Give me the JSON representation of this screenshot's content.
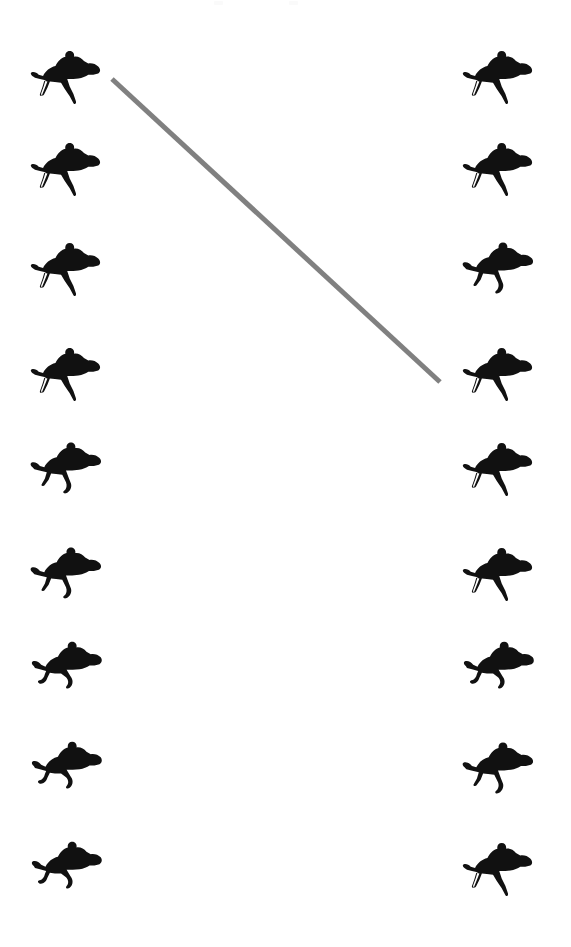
{
  "page": {
    "width": 571,
    "height": 947,
    "background_color": "#ffffff"
  },
  "figure": {
    "type": "silhouette-grid-with-connector",
    "icon_name": "horse-jockey-silhouette",
    "silhouette_color": "#111111",
    "rows": 9,
    "columns": 2
  },
  "columns": [
    {
      "name": "left-column",
      "side": "left",
      "x": 28,
      "count": 9,
      "items": [
        {
          "index": 1,
          "label": "left-horse-1",
          "y": 48,
          "pose": "gallop-extended"
        },
        {
          "index": 2,
          "label": "left-horse-2",
          "y": 140,
          "pose": "gallop-extended"
        },
        {
          "index": 3,
          "label": "left-horse-3",
          "y": 240,
          "pose": "gallop-extended"
        },
        {
          "index": 4,
          "label": "left-horse-4",
          "y": 345,
          "pose": "gallop-extended"
        },
        {
          "index": 5,
          "label": "left-horse-5",
          "y": 440,
          "pose": "gallop-collected"
        },
        {
          "index": 6,
          "label": "left-horse-6",
          "y": 545,
          "pose": "gallop-collected"
        },
        {
          "index": 7,
          "label": "left-horse-7",
          "y": 640,
          "pose": "gallop-tucked"
        },
        {
          "index": 8,
          "label": "left-horse-8",
          "y": 740,
          "pose": "gallop-tucked"
        },
        {
          "index": 9,
          "label": "left-horse-9",
          "y": 840,
          "pose": "gallop-tucked"
        }
      ]
    },
    {
      "name": "right-column",
      "side": "right",
      "x": 460,
      "count": 9,
      "items": [
        {
          "index": 1,
          "label": "right-horse-1",
          "y": 48,
          "pose": "gallop-extended"
        },
        {
          "index": 2,
          "label": "right-horse-2",
          "y": 140,
          "pose": "gallop-extended"
        },
        {
          "index": 3,
          "label": "right-horse-3",
          "y": 240,
          "pose": "gallop-collected"
        },
        {
          "index": 4,
          "label": "right-horse-4",
          "y": 345,
          "pose": "gallop-extended"
        },
        {
          "index": 5,
          "label": "right-horse-5",
          "y": 440,
          "pose": "gallop-extended"
        },
        {
          "index": 6,
          "label": "right-horse-6",
          "y": 545,
          "pose": "gallop-extended"
        },
        {
          "index": 7,
          "label": "right-horse-7",
          "y": 640,
          "pose": "gallop-tucked"
        },
        {
          "index": 8,
          "label": "right-horse-8",
          "y": 740,
          "pose": "gallop-collected"
        },
        {
          "index": 9,
          "label": "right-horse-9",
          "y": 840,
          "pose": "gallop-extended"
        }
      ]
    }
  ],
  "connector": {
    "name": "diagonal-connector-line",
    "color": "#808080",
    "stroke_width": 5,
    "cap": "butt",
    "x1": 112,
    "y1": 79,
    "x2": 440,
    "y2": 382,
    "from": "left-horse-1",
    "to": "right-horse-4"
  },
  "faint_marks": [
    {
      "name": "faint-mark-left",
      "x": 214,
      "y": 1,
      "width": 9,
      "height": 4,
      "color": "#fafafa"
    },
    {
      "name": "faint-mark-right",
      "x": 289,
      "y": 1,
      "width": 9,
      "height": 4,
      "color": "#fafafa"
    }
  ]
}
